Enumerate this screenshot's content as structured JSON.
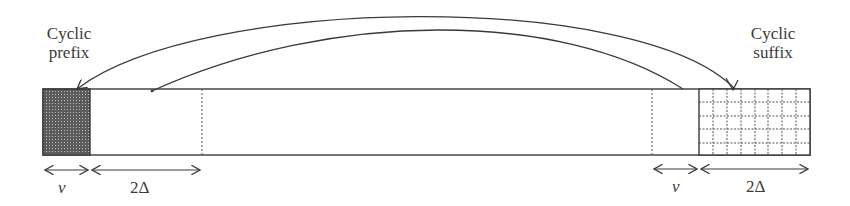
{
  "diagram": {
    "labels": {
      "prefix_line1": "Cyclic",
      "prefix_line2": "prefix",
      "suffix_line1": "Cyclic",
      "suffix_line2": "suffix"
    },
    "dimensions": {
      "left_nu": "ν",
      "left_two_delta": "2Δ",
      "right_nu": "ν",
      "right_two_delta": "2Δ"
    },
    "colors": {
      "stroke": "#3a3a3a",
      "prefix_fill": "#6a6a6a",
      "suffix_grid": "#555555",
      "background": "#ffffff"
    }
  }
}
